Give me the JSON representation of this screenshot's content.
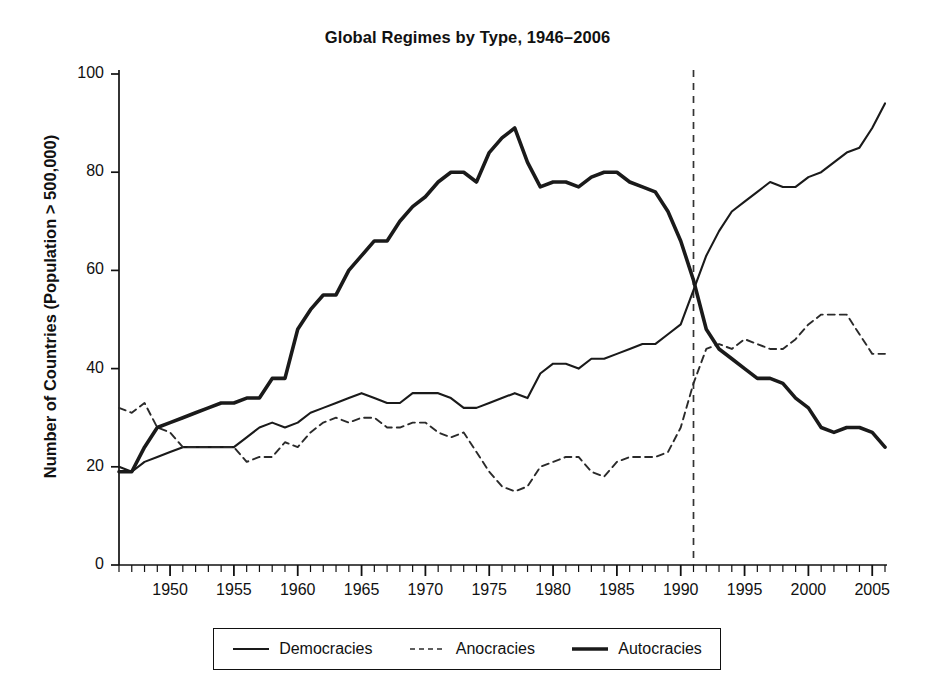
{
  "chart_data": {
    "type": "line",
    "title": "Global Regimes by Type, 1946–2006",
    "xlabel": "",
    "ylabel": "Number of Countries (Population > 500,000)",
    "xlim": [
      1946,
      2006
    ],
    "ylim": [
      0,
      100
    ],
    "grid": false,
    "legend_position": "bottom",
    "x_tick_labels": [
      "1950",
      "1955",
      "1960",
      "1965",
      "1970",
      "1975",
      "1980",
      "1985",
      "1990",
      "1995",
      "2000",
      "2005"
    ],
    "x_tick_values": [
      1950,
      1955,
      1960,
      1965,
      1970,
      1975,
      1980,
      1985,
      1990,
      1995,
      2000,
      2005
    ],
    "x_minor_tick_interval": 1,
    "y_tick_labels": [
      "0",
      "20",
      "40",
      "60",
      "80",
      "100"
    ],
    "y_tick_values": [
      0,
      20,
      40,
      60,
      80,
      100
    ],
    "x": [
      1946,
      1947,
      1948,
      1949,
      1950,
      1951,
      1952,
      1953,
      1954,
      1955,
      1956,
      1957,
      1958,
      1959,
      1960,
      1961,
      1962,
      1963,
      1964,
      1965,
      1966,
      1967,
      1968,
      1969,
      1970,
      1971,
      1972,
      1973,
      1974,
      1975,
      1976,
      1977,
      1978,
      1979,
      1980,
      1981,
      1982,
      1983,
      1984,
      1985,
      1986,
      1987,
      1988,
      1989,
      1990,
      1991,
      1992,
      1993,
      1994,
      1995,
      1996,
      1997,
      1998,
      1999,
      2000,
      2001,
      2002,
      2003,
      2004,
      2005,
      2006
    ],
    "series": [
      {
        "name": "Democracies",
        "style": "solid-thin",
        "color": "#1a1a1a",
        "values": [
          20,
          19,
          21,
          22,
          23,
          24,
          24,
          24,
          24,
          24,
          26,
          28,
          29,
          28,
          29,
          31,
          32,
          33,
          34,
          35,
          34,
          33,
          33,
          35,
          35,
          35,
          34,
          32,
          32,
          33,
          34,
          35,
          34,
          39,
          41,
          41,
          40,
          42,
          42,
          43,
          44,
          45,
          45,
          47,
          49,
          56,
          63,
          68,
          72,
          74,
          76,
          78,
          77,
          77,
          79,
          80,
          82,
          84,
          85,
          89,
          92
        ],
        "value_at_end": 94
      },
      {
        "name": "Anocracies",
        "style": "dashed",
        "color": "#2a2a2a",
        "values": [
          32,
          31,
          33,
          28,
          27,
          24,
          24,
          24,
          24,
          24,
          21,
          22,
          22,
          25,
          24,
          27,
          29,
          30,
          29,
          30,
          30,
          28,
          28,
          29,
          29,
          27,
          26,
          27,
          23,
          19,
          16,
          15,
          16,
          20,
          21,
          22,
          22,
          19,
          18,
          21,
          22,
          22,
          22,
          23,
          28,
          37,
          44,
          45,
          44,
          46,
          45,
          44,
          44,
          46,
          49,
          51,
          51,
          51,
          47,
          43,
          43
        ]
      },
      {
        "name": "Autocracies",
        "style": "solid-thick",
        "color": "#1a1a1a",
        "values": [
          19,
          19,
          24,
          28,
          29,
          30,
          31,
          32,
          33,
          33,
          34,
          34,
          38,
          38,
          48,
          52,
          55,
          55,
          60,
          63,
          66,
          66,
          70,
          73,
          75,
          78,
          80,
          80,
          78,
          84,
          87,
          89,
          82,
          77,
          78,
          78,
          77,
          79,
          80,
          80,
          78,
          77,
          76,
          72,
          66,
          58,
          48,
          44,
          42,
          40,
          38,
          38,
          37,
          34,
          32,
          28,
          27,
          28,
          28,
          27,
          24
        ]
      }
    ],
    "annotations": [
      {
        "type": "vertical-line",
        "name": "year-1991-marker",
        "x": 1991,
        "style": "dashed",
        "label": ""
      }
    ]
  },
  "legend": {
    "entries": [
      {
        "label": "Democracies",
        "style": "solid-thin"
      },
      {
        "label": "Anocracies",
        "style": "dashed"
      },
      {
        "label": "Autocracies",
        "style": "solid-thick"
      }
    ]
  }
}
